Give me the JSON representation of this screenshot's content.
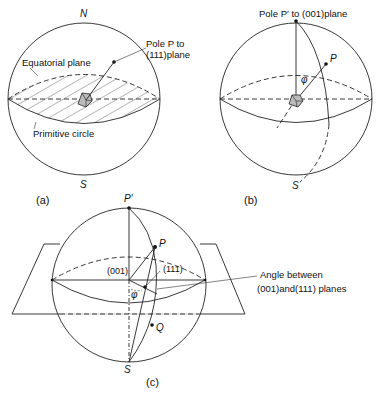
{
  "figure": {
    "panel_a": {
      "caption": "(a)",
      "north_label": "N",
      "south_label": "S",
      "equatorial_plane_label": "Equatorial plane",
      "primitive_circle_label": "Primitive circle",
      "pole_label_line1": "Pole P to",
      "pole_label_line2": "(111)plane"
    },
    "panel_b": {
      "caption": "(b)",
      "pole_label": "Pole P′ to (001)plane",
      "p_label": "P",
      "phi_label": "φ",
      "south_label": "S"
    },
    "panel_c": {
      "caption": "(c)",
      "p_prime_label": "P′",
      "p_label": "P",
      "plane_001_label": "(001)",
      "plane_111_label": "(111)",
      "phi_label": "φ",
      "q_label": "Q",
      "south_label": "S",
      "angle_label_line1": "Angle between",
      "angle_label_line2": "(001)and(111) planes"
    }
  }
}
